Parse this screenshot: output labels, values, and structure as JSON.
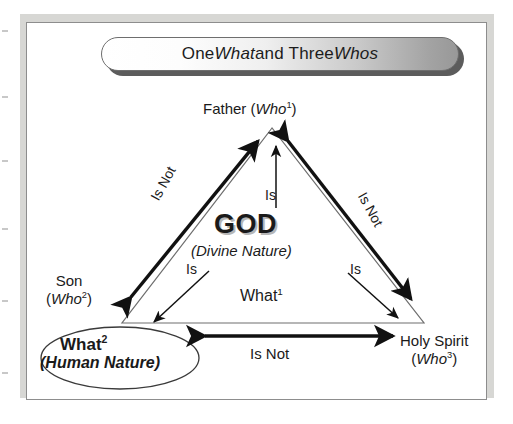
{
  "figure": {
    "type": "trinity-diagram",
    "title_banner": {
      "text_parts": [
        {
          "text": "One ",
          "style": "regular"
        },
        {
          "text": "What",
          "style": "italic"
        },
        {
          "text": " and Three ",
          "style": "regular"
        },
        {
          "text": "Whos",
          "style": "italic"
        }
      ],
      "plain_text": "One What and Three Whos"
    },
    "center": {
      "primary": "GOD",
      "secondary": "(Divine Nature)",
      "tertiary": "What",
      "tertiary_sup": "1"
    },
    "nodes": [
      {
        "id": "father",
        "name": "Father",
        "paren_open": "(",
        "who": "Who",
        "sup": "1",
        "paren_close": ")"
      },
      {
        "id": "son",
        "name": "Son",
        "paren_open": "(",
        "who": "Who",
        "sup": "2",
        "paren_close": ")"
      },
      {
        "id": "holy-spirit",
        "name": "Holy Spirit",
        "paren_open": "(",
        "who": "Who",
        "sup": "3",
        "paren_close": ")"
      }
    ],
    "ellipse_node": {
      "id": "human-nature",
      "line1": "What",
      "line1_sup": "2",
      "line2": "(Human Nature)"
    },
    "edges": [
      {
        "id": "son-father",
        "label": "Is Not",
        "kind": "double-arrow-thick",
        "rotation_deg": -61
      },
      {
        "id": "father-holy-spirit",
        "label": "Is Not",
        "kind": "double-arrow-thick",
        "rotation_deg": 61
      },
      {
        "id": "human-nature-holy-spirit",
        "label": "Is Not",
        "kind": "double-arrow-thick",
        "rotation_deg": 0
      }
    ],
    "spokes": [
      {
        "id": "god-father",
        "label": "Is",
        "kind": "single-arrow-thin",
        "direction": "up"
      },
      {
        "id": "god-human-nature",
        "label": "Is",
        "kind": "single-arrow-thin",
        "direction": "down-left"
      },
      {
        "id": "god-holy-spirit",
        "label": "Is",
        "kind": "single-arrow-thin",
        "direction": "down-right"
      }
    ],
    "colors": {
      "page_background": "#ffffff",
      "backing_sheet": "#d7d7d4",
      "frame_border": "#8d8d8d",
      "ink": "#1a1a1a",
      "banner_gradient_start": "#ffffff",
      "banner_gradient_end": "#989898",
      "banner_shadow": "#5c5c5c",
      "god_shadow": "#b6b6b6",
      "triangle_stroke": "#6e6e6e"
    }
  }
}
